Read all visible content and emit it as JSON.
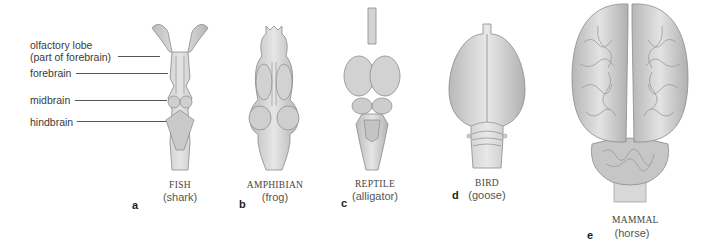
{
  "structure_labels": [
    {
      "id": "olfactory",
      "line1": "olfactory lobe",
      "line2": "(part of forebrain)"
    },
    {
      "id": "forebrain",
      "line1": "forebrain"
    },
    {
      "id": "midbrain",
      "line1": "midbrain"
    },
    {
      "id": "hindbrain",
      "line1": "hindbrain"
    }
  ],
  "panels": [
    {
      "letter": "a",
      "class": "FISH",
      "species": "(shark)"
    },
    {
      "letter": "b",
      "class": "AMPHIBIAN",
      "species": "(frog)"
    },
    {
      "letter": "c",
      "class": "REPTILE",
      "species": "(alligator)"
    },
    {
      "letter": "d",
      "class": "BIRD",
      "species": "(goose)"
    },
    {
      "letter": "e",
      "class": "MAMMAL",
      "species": "(horse)"
    }
  ],
  "colors": {
    "brain_fill": "#d6d6d6",
    "brain_shade": "#a9a9a9",
    "outline": "#8a8a8a"
  }
}
